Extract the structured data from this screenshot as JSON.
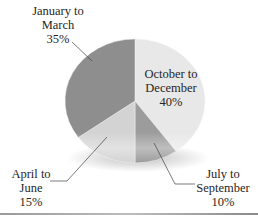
{
  "chart_data": {
    "type": "pie",
    "title": "",
    "style": "3d-tilted",
    "start_angle_deg": 0,
    "direction": "clockwise",
    "slices": [
      {
        "label": "October to December",
        "value": 40,
        "display": "40%",
        "color": "#e8e8e8"
      },
      {
        "label": "July to September",
        "value": 10,
        "display": "10%",
        "color": "#9c9c9c"
      },
      {
        "label": "April to June",
        "value": 15,
        "display": "15%",
        "color": "#d3d3d3"
      },
      {
        "label": "January to March",
        "value": 35,
        "display": "35%",
        "color": "#8e8e8e"
      }
    ],
    "legend": "none (callout labels)"
  },
  "labels": {
    "jan_mar": {
      "line1": "January to",
      "line2": "March",
      "pct": "35%"
    },
    "oct_dec": {
      "line1": "October to",
      "line2": "December",
      "pct": "40%"
    },
    "apr_jun": {
      "line1": "April to",
      "line2": "June",
      "pct": "15%"
    },
    "jul_sep": {
      "line1": "July to",
      "line2": "September",
      "pct": "10%"
    }
  }
}
